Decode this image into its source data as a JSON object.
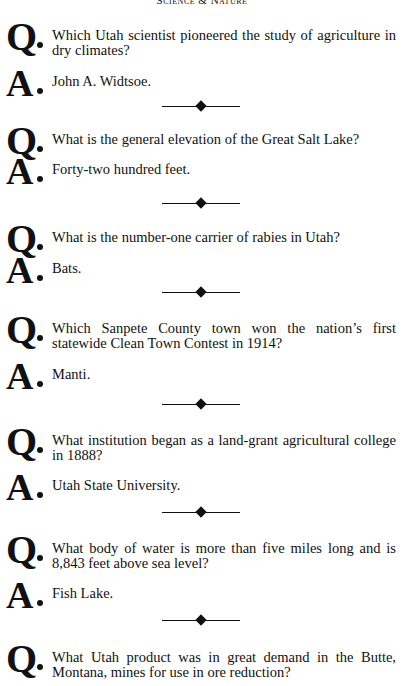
{
  "header": {
    "title": "Science & Nature"
  },
  "qa": [
    {
      "q_marker": "Q",
      "question": "Which Utah scientist pioneered the study of agriculture in dry climates?",
      "a_marker": "A",
      "answer": "John A. Widtsoe."
    },
    {
      "q_marker": "Q",
      "question": "What is the general elevation of the Great Salt Lake?",
      "a_marker": "A",
      "answer": "Forty-two hundred feet."
    },
    {
      "q_marker": "Q",
      "question": "What is the number-one carrier of rabies in Utah?",
      "a_marker": "A",
      "answer": "Bats."
    },
    {
      "q_marker": "Q",
      "question": "Which Sanpete County town won the nation’s first statewide Clean Town Contest in 1914?",
      "a_marker": "A",
      "answer": "Manti."
    },
    {
      "q_marker": "Q",
      "question": "What institution began as a land-grant agricultural college in 1888?",
      "a_marker": "A",
      "answer": "Utah State University."
    },
    {
      "q_marker": "Q",
      "question": "What body of water is more than five miles long and is 8,843 feet above sea level?",
      "a_marker": "A",
      "answer": "Fish Lake."
    },
    {
      "q_marker": "Q",
      "question": "What Utah product was in great demand in the Butte, Montana, mines for use in ore reduction?"
    }
  ],
  "divider_icon": "diamond-divider-icon"
}
